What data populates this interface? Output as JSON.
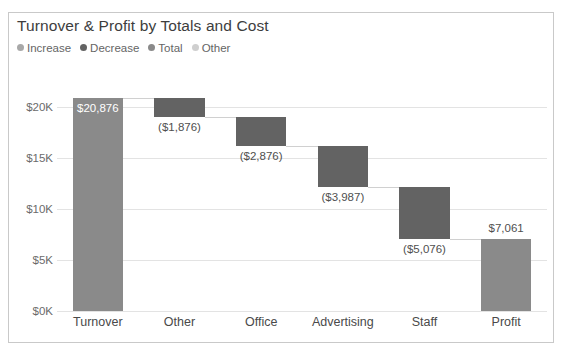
{
  "card": {
    "border_color": "#c9c9c9",
    "background": "#ffffff"
  },
  "header": {
    "title": "Turnover & Profit by Totals and Cost"
  },
  "legend": {
    "items": [
      {
        "label": "Increase",
        "color": "#a8a8a8"
      },
      {
        "label": "Decrease",
        "color": "#636363"
      },
      {
        "label": "Total",
        "color": "#8a8a8a"
      },
      {
        "label": "Other",
        "color": "#cfcfcf"
      }
    ]
  },
  "chart_data": {
    "type": "bar",
    "subtype": "waterfall",
    "title": "Turnover & Profit by Totals and Cost",
    "xlabel": "",
    "ylabel": "",
    "ylim": [
      0,
      23000
    ],
    "grid": true,
    "legend_position": "top-left",
    "categories": [
      "Turnover",
      "Other",
      "Office",
      "Advertising",
      "Staff",
      "Profit"
    ],
    "values": [
      20876,
      -1876,
      -2876,
      -3987,
      -5076,
      7061
    ],
    "value_labels": [
      "$20,876",
      "($1,876)",
      "($2,876)",
      "($3,987)",
      "($5,076)",
      "$7,061"
    ],
    "kinds": [
      "total",
      "decrease",
      "decrease",
      "decrease",
      "decrease",
      "total"
    ],
    "bar_colors": [
      "#8a8a8a",
      "#636363",
      "#636363",
      "#636363",
      "#636363",
      "#8a8a8a"
    ],
    "bar_starts": [
      0,
      19000,
      16124,
      12137,
      7061,
      0
    ],
    "bar_ends": [
      20876,
      20876,
      19000,
      16124,
      12137,
      7061
    ],
    "running_totals": [
      20876,
      19000,
      16124,
      12137,
      7061,
      7061
    ],
    "label_placement": [
      "inside",
      "below",
      "below",
      "below",
      "below",
      "above"
    ],
    "yticks": [
      0,
      5000,
      10000,
      15000,
      20000
    ],
    "ytick_labels": [
      "$0K",
      "$5K",
      "$10K",
      "$15K",
      "$20K"
    ],
    "connector_color": "#d0d0d0"
  }
}
